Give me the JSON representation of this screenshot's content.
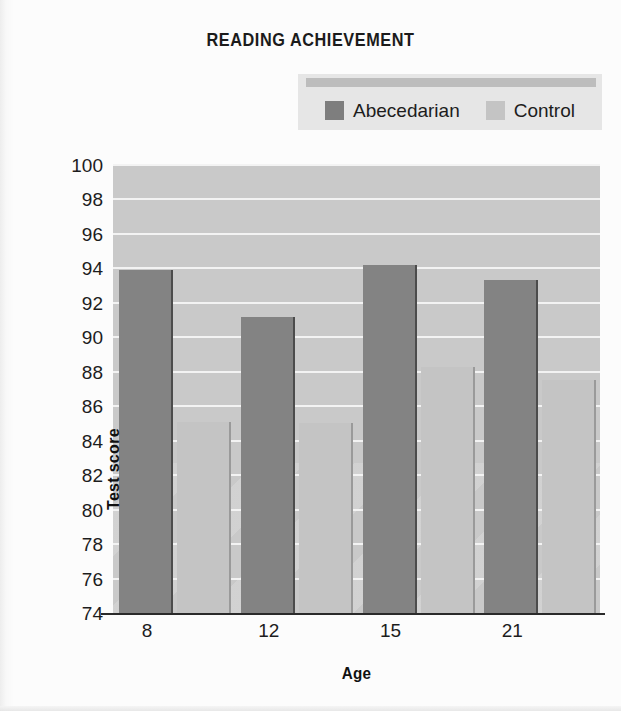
{
  "title": "READING ACHIEVEMENT",
  "legend": {
    "items": [
      {
        "label": "Abecedarian",
        "swatch": "dark-gray-swatch-icon",
        "color": "#7e7e7e"
      },
      {
        "label": "Control",
        "swatch": "light-gray-swatch-icon",
        "color": "#c4c4c4"
      }
    ]
  },
  "axes": {
    "x_title": "Age",
    "y_title": "Test score",
    "y_ticks": [
      100,
      98,
      96,
      94,
      92,
      90,
      88,
      86,
      84,
      82,
      80,
      78,
      76,
      74
    ],
    "x_ticks": [
      "8",
      "12",
      "15",
      "21"
    ]
  },
  "colors": {
    "plot_background": "#c9c9c9",
    "gridline": "#f3f3f3",
    "axis": "#2a2a2a",
    "legend_background": "#e6e6e6",
    "legend_topbar": "#bdbdbd",
    "page_background": "#fbfbfb",
    "bar_dark": "#838383",
    "bar_light": "#c4c4c4"
  },
  "chart_data": {
    "type": "bar",
    "title": "READING ACHIEVEMENT",
    "xlabel": "Age",
    "ylabel": "Test score",
    "categories": [
      "8",
      "12",
      "15",
      "21"
    ],
    "series": [
      {
        "name": "Abecedarian",
        "color": "#838383",
        "values": [
          93.9,
          91.2,
          94.2,
          93.3
        ]
      },
      {
        "name": "Control",
        "color": "#c4c4c4",
        "values": [
          85.1,
          85.0,
          88.3,
          87.5
        ]
      }
    ],
    "ylim": [
      74,
      100
    ],
    "ytick_step": 2,
    "grid": true,
    "legend_position": "top"
  }
}
